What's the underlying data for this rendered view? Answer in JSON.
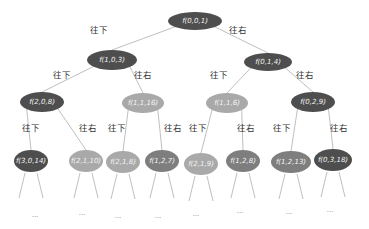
{
  "diagram": {
    "type": "recursion-tree",
    "colors": {
      "dark": "#4e4e4e",
      "medium": "#7e7e7e",
      "light": "#a9a9a9",
      "edge": "#b8b8b8",
      "background": "#ffffff"
    },
    "edge_labels": {
      "down": "往下",
      "right": "往右"
    },
    "ellipsis": "...",
    "nodes": [
      {
        "id": "n0",
        "label": "f(0,0,1)",
        "cx": 195,
        "cy": 21,
        "rx": 27,
        "ry": 9,
        "shade": "dark"
      },
      {
        "id": "n1",
        "label": "f(1,0,3)",
        "cx": 112,
        "cy": 60,
        "rx": 25,
        "ry": 10,
        "shade": "dark"
      },
      {
        "id": "n2",
        "label": "f(0,1,4)",
        "cx": 268,
        "cy": 62,
        "rx": 24,
        "ry": 9,
        "shade": "dark"
      },
      {
        "id": "n3",
        "label": "f(2,0,8)",
        "cx": 42,
        "cy": 102,
        "rx": 22,
        "ry": 10,
        "shade": "dark"
      },
      {
        "id": "n4",
        "label": "f(1,1,16)",
        "cx": 143,
        "cy": 103,
        "rx": 21,
        "ry": 10,
        "shade": "light"
      },
      {
        "id": "n5",
        "label": "f(1,1,6)",
        "cx": 227,
        "cy": 103,
        "rx": 21,
        "ry": 10,
        "shade": "light"
      },
      {
        "id": "n6",
        "label": "f(0,2,9)",
        "cx": 313,
        "cy": 102,
        "rx": 22,
        "ry": 10,
        "shade": "dark"
      },
      {
        "id": "n7",
        "label": "f(3,0,14)",
        "cx": 31,
        "cy": 161,
        "rx": 17,
        "ry": 11,
        "shade": "dark"
      },
      {
        "id": "n8",
        "label": "f(2,1,10)",
        "cx": 86,
        "cy": 161,
        "rx": 17,
        "ry": 11,
        "shade": "light"
      },
      {
        "id": "n9",
        "label": "f(2,1,8)",
        "cx": 123,
        "cy": 162,
        "rx": 17,
        "ry": 11,
        "shade": "light"
      },
      {
        "id": "n10",
        "label": "f(1,2,7)",
        "cx": 162,
        "cy": 161,
        "rx": 17,
        "ry": 11,
        "shade": "medium"
      },
      {
        "id": "n11",
        "label": "f(2,1,9)",
        "cx": 201,
        "cy": 164,
        "rx": 17,
        "ry": 11,
        "shade": "light"
      },
      {
        "id": "n12",
        "label": "f(1,2,8)",
        "cx": 243,
        "cy": 161,
        "rx": 17,
        "ry": 11,
        "shade": "medium"
      },
      {
        "id": "n13",
        "label": "f(1,2,13)",
        "cx": 291,
        "cy": 162,
        "rx": 20,
        "ry": 11,
        "shade": "medium"
      },
      {
        "id": "n14",
        "label": "f(0,3,18)",
        "cx": 333,
        "cy": 160,
        "rx": 19,
        "ry": 11,
        "shade": "dark"
      }
    ],
    "edges": [
      {
        "from": "n0",
        "to": "n1",
        "dir": "down",
        "label_x": 90,
        "label_y": 33
      },
      {
        "from": "n0",
        "to": "n2",
        "dir": "right",
        "label_x": 229,
        "label_y": 33
      },
      {
        "from": "n1",
        "to": "n3",
        "dir": "down",
        "label_x": 53,
        "label_y": 78
      },
      {
        "from": "n1",
        "to": "n4",
        "dir": "right",
        "label_x": 134,
        "label_y": 78
      },
      {
        "from": "n2",
        "to": "n5",
        "dir": "down",
        "label_x": 210,
        "label_y": 78
      },
      {
        "from": "n2",
        "to": "n6",
        "dir": "right",
        "label_x": 296,
        "label_y": 78
      },
      {
        "from": "n3",
        "to": "n7",
        "dir": "down",
        "label_x": 22,
        "label_y": 131
      },
      {
        "from": "n3",
        "to": "n8",
        "dir": "right",
        "label_x": 79,
        "label_y": 131
      },
      {
        "from": "n4",
        "to": "n9",
        "dir": "down",
        "label_x": 108,
        "label_y": 131
      },
      {
        "from": "n4",
        "to": "n10",
        "dir": "right",
        "label_x": 164,
        "label_y": 131
      },
      {
        "from": "n5",
        "to": "n11",
        "dir": "down",
        "label_x": 189,
        "label_y": 131
      },
      {
        "from": "n5",
        "to": "n12",
        "dir": "right",
        "label_x": 237,
        "label_y": 131
      },
      {
        "from": "n6",
        "to": "n13",
        "dir": "down",
        "label_x": 273,
        "label_y": 131
      },
      {
        "from": "n6",
        "to": "n14",
        "dir": "right",
        "label_x": 330,
        "label_y": 131
      }
    ],
    "leaf_ellipses": [
      {
        "x": 35,
        "y": 217
      },
      {
        "x": 82,
        "y": 215
      },
      {
        "x": 118,
        "y": 218
      },
      {
        "x": 158,
        "y": 218
      },
      {
        "x": 196,
        "y": 216
      },
      {
        "x": 240,
        "y": 213
      },
      {
        "x": 289,
        "y": 214
      },
      {
        "x": 330,
        "y": 212
      }
    ]
  }
}
